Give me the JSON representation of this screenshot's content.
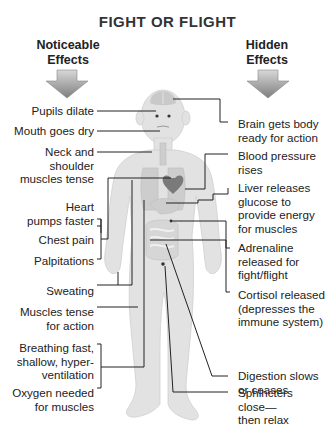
{
  "title": "FIGHT OR FLIGHT",
  "headers": {
    "left": [
      "Noticeable",
      "Effects"
    ],
    "right": [
      "Hidden",
      "Effects"
    ]
  },
  "left_effects": [
    {
      "lines": [
        "Pupils dilate"
      ]
    },
    {
      "lines": [
        "Mouth goes dry"
      ]
    },
    {
      "lines": [
        "Neck and",
        "shoulder",
        "muscles tense"
      ]
    },
    {
      "lines": [
        "Heart",
        "pumps faster"
      ]
    },
    {
      "lines": [
        "Chest pain"
      ]
    },
    {
      "lines": [
        "Palpitations"
      ]
    },
    {
      "lines": [
        "Sweating"
      ]
    },
    {
      "lines": [
        "Muscles tense",
        "for action"
      ]
    },
    {
      "lines": [
        "Breathing fast,",
        "shallow, hyper-",
        "ventilation"
      ]
    },
    {
      "lines": [
        "Oxygen needed",
        "for muscles"
      ]
    }
  ],
  "right_effects": [
    {
      "lines": [
        "Brain gets body",
        "ready for action"
      ]
    },
    {
      "lines": [
        "Blood pressure",
        "rises"
      ]
    },
    {
      "lines": [
        "Liver releases",
        "glucose to",
        "provide energy",
        "for muscles"
      ]
    },
    {
      "lines": [
        "Adrenaline",
        "released for",
        "fight/flight"
      ]
    },
    {
      "lines": [
        "Cortisol released",
        "(depresses the",
        "immune system)"
      ]
    },
    {
      "lines": [
        "Digestion slows",
        "or ceases"
      ]
    },
    {
      "lines": [
        "Sphincters",
        "close—",
        "then relax"
      ]
    }
  ],
  "icons": {
    "left_arrow": "down-arrow",
    "right_arrow": "down-arrow",
    "figure": "human-body-outline",
    "heart": "heart"
  },
  "colors": {
    "background": "#ffffff",
    "text": "#222222",
    "body_fill": "#e2e2e2",
    "organ_fill": "#c9c9c9",
    "heart_fill": "#7a7a7a",
    "arrow_fill": "#9a9a9a",
    "connector": "#222222"
  }
}
